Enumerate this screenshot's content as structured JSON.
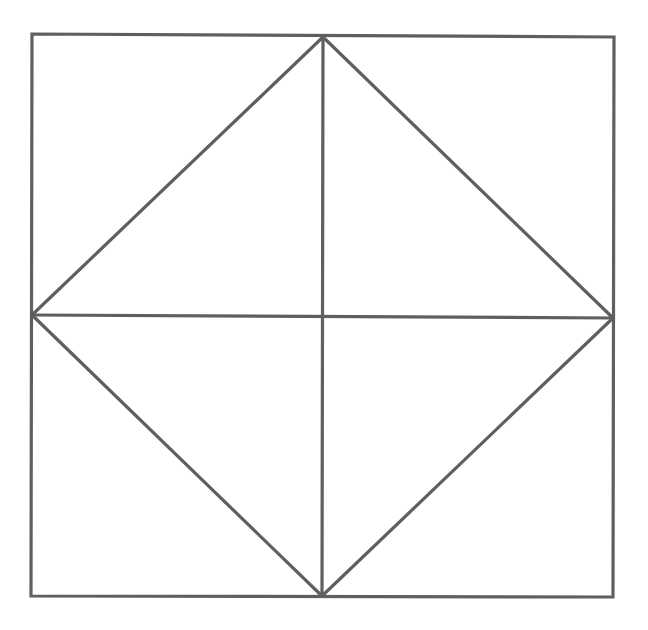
{
  "diagram": {
    "canvas": {
      "width": 648,
      "height": 630,
      "background": "#ffffff"
    },
    "stroke": {
      "color": "#5f5f5f",
      "width": 3.2
    },
    "square": {
      "corners": {
        "top_left": [
          32,
          34
        ],
        "top_right": [
          614,
          37
        ],
        "bottom_right": [
          613,
          597
        ],
        "bottom_left": [
          31,
          596
        ]
      }
    },
    "midpoints": {
      "top": [
        323,
        37
      ],
      "right": [
        613,
        318
      ],
      "bottom": [
        322,
        596
      ],
      "left": [
        32,
        315
      ]
    },
    "segments": [
      {
        "name": "vertical-midline",
        "from": [
          323,
          37
        ],
        "to": [
          322,
          596
        ]
      },
      {
        "name": "horizontal-midline",
        "from": [
          32,
          315
        ],
        "to": [
          613,
          318
        ]
      },
      {
        "name": "diamond-edge-top-left",
        "from": [
          32,
          315
        ],
        "to": [
          323,
          37
        ]
      },
      {
        "name": "diamond-edge-top-right",
        "from": [
          323,
          37
        ],
        "to": [
          613,
          318
        ]
      },
      {
        "name": "diamond-edge-bottom-right",
        "from": [
          613,
          318
        ],
        "to": [
          322,
          596
        ]
      },
      {
        "name": "diamond-edge-bottom-left",
        "from": [
          322,
          596
        ],
        "to": [
          32,
          315
        ]
      }
    ]
  }
}
